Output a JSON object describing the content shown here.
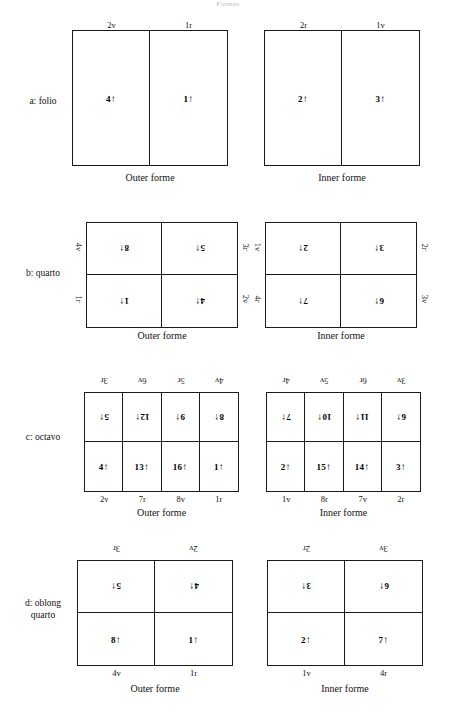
{
  "page": {
    "title": "Formes"
  },
  "captions": {
    "outer": "Outer forme",
    "inner": "Inner forme"
  },
  "sections": [
    {
      "id": "folio",
      "label_line1": "a: folio",
      "label_line2": "",
      "outer": {
        "caption": "Outer forme",
        "top_labels": [
          "2v",
          "1r"
        ],
        "bottom_labels": [],
        "left_labels": [],
        "right_labels": [],
        "cells": [
          {
            "num": "4",
            "arrow": "↑",
            "flip": false
          },
          {
            "num": "1",
            "arrow": "↑",
            "flip": false
          }
        ]
      },
      "inner": {
        "caption": "Inner forme",
        "top_labels": [
          "2r",
          "1v"
        ],
        "bottom_labels": [],
        "left_labels": [],
        "right_labels": [],
        "cells": [
          {
            "num": "2",
            "arrow": "↑",
            "flip": false
          },
          {
            "num": "3",
            "arrow": "↑",
            "flip": false
          }
        ]
      }
    },
    {
      "id": "quarto",
      "label_line1": "b: quarto",
      "label_line2": "",
      "outer": {
        "caption": "Outer forme",
        "top_labels": [],
        "bottom_labels": [],
        "left_labels": [
          "4v",
          "1r"
        ],
        "right_labels": [
          "3r",
          "2v"
        ],
        "cells": [
          {
            "num": "8",
            "arrow": "↑",
            "flip": true
          },
          {
            "num": "5",
            "arrow": "↑",
            "flip": true
          },
          {
            "num": "1",
            "arrow": "↑",
            "flip": true
          },
          {
            "num": "4",
            "arrow": "↑",
            "flip": true
          }
        ]
      },
      "inner": {
        "caption": "Inner forme",
        "top_labels": [],
        "bottom_labels": [],
        "left_labels": [
          "1v",
          "4r"
        ],
        "right_labels": [
          "2r",
          "3v"
        ],
        "cells": [
          {
            "num": "2",
            "arrow": "↑",
            "flip": true
          },
          {
            "num": "3",
            "arrow": "↑",
            "flip": true
          },
          {
            "num": "7",
            "arrow": "↑",
            "flip": true
          },
          {
            "num": "6",
            "arrow": "↑",
            "flip": true
          }
        ]
      }
    },
    {
      "id": "octavo",
      "label_line1": "c: octavo",
      "label_line2": "",
      "outer": {
        "caption": "Outer forme",
        "top_labels": [
          "3r",
          "6v",
          "5r",
          "4v"
        ],
        "bottom_labels": [
          "2v",
          "7r",
          "8v",
          "1r"
        ],
        "left_labels": [],
        "right_labels": [],
        "cells": [
          {
            "num": "5",
            "arrow": "↑",
            "flip": true
          },
          {
            "num": "12",
            "arrow": "↑",
            "flip": true
          },
          {
            "num": "9",
            "arrow": "↑",
            "flip": true
          },
          {
            "num": "8",
            "arrow": "↑",
            "flip": true
          },
          {
            "num": "4",
            "arrow": "↑",
            "flip": false
          },
          {
            "num": "13",
            "arrow": "↑",
            "flip": false
          },
          {
            "num": "16",
            "arrow": "↑",
            "flip": false
          },
          {
            "num": "1",
            "arrow": "↑",
            "flip": false
          }
        ]
      },
      "inner": {
        "caption": "Inner forme",
        "top_labels": [
          "4r",
          "5v",
          "6r",
          "3v"
        ],
        "bottom_labels": [
          "1v",
          "8r",
          "7v",
          "2r"
        ],
        "left_labels": [],
        "right_labels": [],
        "cells": [
          {
            "num": "7",
            "arrow": "↑",
            "flip": true
          },
          {
            "num": "10",
            "arrow": "↑",
            "flip": true
          },
          {
            "num": "11",
            "arrow": "↑",
            "flip": true
          },
          {
            "num": "6",
            "arrow": "↑",
            "flip": true
          },
          {
            "num": "2",
            "arrow": "↑",
            "flip": false
          },
          {
            "num": "15",
            "arrow": "↑",
            "flip": false
          },
          {
            "num": "14",
            "arrow": "↑",
            "flip": false
          },
          {
            "num": "3",
            "arrow": "↑",
            "flip": false
          }
        ]
      }
    },
    {
      "id": "oblong-quarto",
      "label_line1": "d: oblong",
      "label_line2": "quarto",
      "outer": {
        "caption": "Outer forme",
        "top_labels": [
          "3r",
          "2v"
        ],
        "bottom_labels": [
          "4v",
          "1r"
        ],
        "left_labels": [],
        "right_labels": [],
        "cells": [
          {
            "num": "5",
            "arrow": "↑",
            "flip": true
          },
          {
            "num": "4",
            "arrow": "↑",
            "flip": true
          },
          {
            "num": "8",
            "arrow": "↑",
            "flip": false
          },
          {
            "num": "1",
            "arrow": "↑",
            "flip": false
          }
        ]
      },
      "inner": {
        "caption": "Inner forme",
        "top_labels": [
          "2r",
          "3v"
        ],
        "bottom_labels": [
          "1v",
          "4r"
        ],
        "left_labels": [],
        "right_labels": [],
        "cells": [
          {
            "num": "3",
            "arrow": "↑",
            "flip": true
          },
          {
            "num": "6",
            "arrow": "↑",
            "flip": true
          },
          {
            "num": "2",
            "arrow": "↑",
            "flip": false
          },
          {
            "num": "7",
            "arrow": "↑",
            "flip": false
          }
        ]
      }
    }
  ]
}
